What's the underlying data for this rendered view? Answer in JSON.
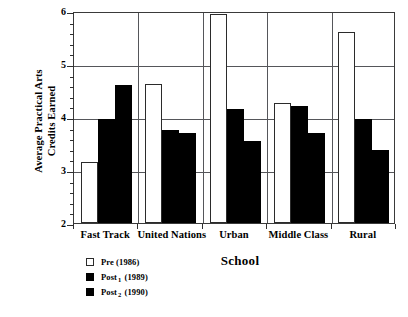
{
  "chart_data": {
    "type": "bar",
    "title": "",
    "xlabel": "School",
    "ylabel": "Average Practical Arts Credits Earned",
    "ylabel_line1": "Average Practical Arts",
    "ylabel_line2": "Credits Earned",
    "categories": [
      "Fast Track",
      "United Nations",
      "Urban",
      "Middle Class",
      "Rural"
    ],
    "series": [
      {
        "name": "Pre (1986)",
        "values": [
          3.15,
          4.62,
          5.95,
          4.27,
          5.6
        ]
      },
      {
        "name": "Post1 (1989)",
        "values": [
          3.97,
          3.76,
          4.15,
          4.2,
          3.97
        ]
      },
      {
        "name": "Post2 (1990)",
        "values": [
          4.6,
          3.7,
          3.55,
          3.7,
          3.38
        ]
      }
    ],
    "ylim": [
      2,
      6
    ],
    "ytick_labels": [
      "2",
      "3",
      "4",
      "5",
      "6"
    ],
    "ytick_values": [
      2,
      3,
      4,
      5,
      6
    ],
    "minor_ticks_per_interval": 4,
    "grid": "horizontal-major-and-group-separators",
    "legend_position": "below-left"
  },
  "legend": {
    "entries": [
      {
        "label": "Pre (1986)",
        "text_main": "Pre (1986)",
        "sub": "",
        "swatch": "open"
      },
      {
        "label": "Post1 (1989)",
        "text_main": "Post",
        "sub": "1",
        "text_tail": " (1989)",
        "swatch": "filled"
      },
      {
        "label": "Post2 (1990)",
        "text_main": "Post",
        "sub": "2",
        "text_tail": " (1990)",
        "swatch": "filled"
      }
    ]
  },
  "colors": {
    "pre_fill": "#ffffff",
    "pre_border": "#2b2b2b",
    "post_fill": "#000000",
    "grid": "#55565a",
    "axis": "#2f2f2f",
    "background": "#ffffff"
  }
}
